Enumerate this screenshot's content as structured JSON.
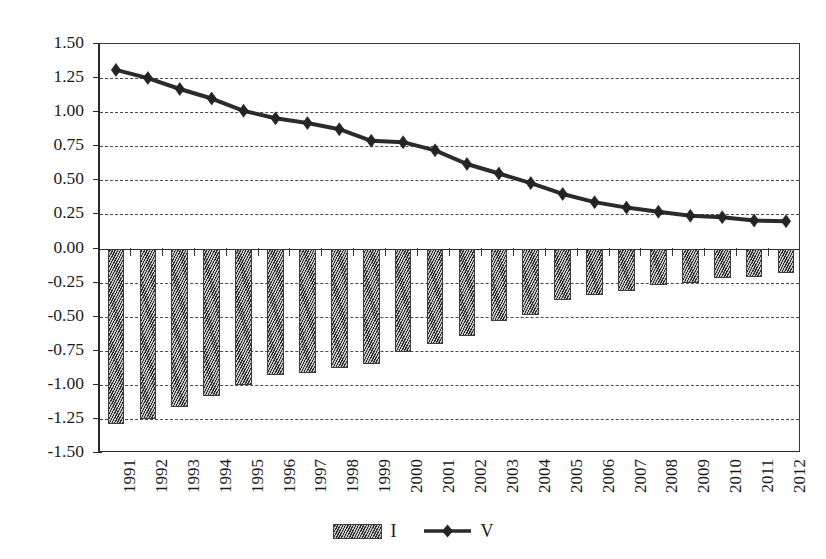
{
  "chart_data": {
    "type": "bar",
    "title": "",
    "subtitle": "",
    "xlabel": "",
    "ylabel": "",
    "ylim": [
      -1.5,
      1.5
    ],
    "ytick_step": 0.25,
    "yticks": [
      "1.50",
      "1.25",
      "1.00",
      "0.75",
      "0.50",
      "0.25",
      "0.00",
      "-0.25",
      "-0.50",
      "-0.75",
      "-1.00",
      "-1.25",
      "-1.50"
    ],
    "ytick_values": [
      1.5,
      1.25,
      1.0,
      0.75,
      0.5,
      0.25,
      0.0,
      -0.25,
      -0.5,
      -0.75,
      -1.0,
      -1.25,
      -1.5
    ],
    "grid": true,
    "grid_style": "dashed-horizontal",
    "legend_position": "bottom-center",
    "categories": [
      "1991",
      "1992",
      "1993",
      "1994",
      "1995",
      "1996",
      "1997",
      "1998",
      "1999",
      "2000",
      "2001",
      "2002",
      "2003",
      "2004",
      "2005",
      "2006",
      "2007",
      "2008",
      "2009",
      "2010",
      "2011",
      "2012"
    ],
    "series": [
      {
        "name": "I",
        "type": "bar",
        "color": "#6e6e6e",
        "pattern": "diagonal-hatch",
        "values": [
          -1.29,
          -1.25,
          -1.16,
          -1.08,
          -1.0,
          -0.93,
          -0.91,
          -0.88,
          -0.85,
          -0.76,
          -0.7,
          -0.64,
          -0.53,
          -0.49,
          -0.38,
          -0.34,
          -0.31,
          -0.27,
          -0.25,
          -0.22,
          -0.21,
          -0.18
        ]
      },
      {
        "name": "V",
        "type": "line",
        "color": "#2b2b2b",
        "marker": "diamond",
        "values": [
          1.31,
          1.25,
          1.17,
          1.1,
          1.01,
          0.955,
          0.92,
          0.875,
          0.79,
          0.78,
          0.72,
          0.62,
          0.55,
          0.48,
          0.4,
          0.34,
          0.3,
          0.27,
          0.24,
          0.23,
          0.205,
          0.2
        ]
      }
    ]
  },
  "legend": {
    "entries": [
      {
        "label": "I",
        "swatch": "hatched-bar-swatch"
      },
      {
        "label": "V",
        "swatch": "line-diamond-swatch"
      }
    ]
  }
}
